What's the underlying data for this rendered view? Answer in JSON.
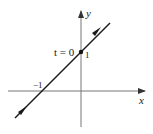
{
  "diagram": {
    "type": "parametric-line-plot",
    "axes": {
      "x_label": "x",
      "y_label": "y"
    },
    "line": {
      "description": "line y = x + 1 traversed in increasing direction",
      "direction": "up-right"
    },
    "points": [
      {
        "label_left": "t = 0",
        "label_right": "1",
        "x": 0,
        "y": 1
      }
    ],
    "intercepts": [
      {
        "label": "−1",
        "x": -1,
        "y": 0
      }
    ],
    "colors": {
      "axis": "#777777",
      "line": "#1a1a1a",
      "text": "#222222"
    }
  }
}
